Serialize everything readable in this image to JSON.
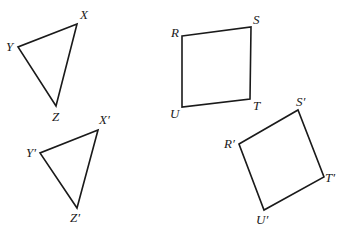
{
  "figure": {
    "stroke_color": "#1a1a1a",
    "background": "#ffffff"
  },
  "shapes": {
    "triangle_xyz": {
      "name": "XYZ",
      "points": "77,24 18,47 56,106",
      "labels": {
        "X": {
          "text": "X",
          "x": 80,
          "y": 19
        },
        "Y": {
          "text": "Y",
          "x": 6,
          "y": 51
        },
        "Z": {
          "text": "Z",
          "x": 52,
          "y": 121
        }
      }
    },
    "quad_rstu": {
      "name": "RSTU",
      "points": "182,36 251,27 250,99 182,107",
      "labels": {
        "R": {
          "text": "R",
          "x": 171,
          "y": 37
        },
        "S": {
          "text": "S",
          "x": 253,
          "y": 24
        },
        "T": {
          "text": "T",
          "x": 253,
          "y": 110
        },
        "U": {
          "text": "U",
          "x": 170,
          "y": 118
        }
      }
    },
    "triangle_xyz_prime": {
      "name": "X'Y'Z'",
      "points": "98,130 40,153 77,208",
      "labels": {
        "X": {
          "text": "X′",
          "x": 99,
          "y": 124
        },
        "Y": {
          "text": "Y′",
          "x": 26,
          "y": 157
        },
        "Z": {
          "text": "Z′",
          "x": 70,
          "y": 222
        }
      }
    },
    "quad_rstu_prime": {
      "name": "R'S'T'U'",
      "points": "239,144 298,110 324,177 264,210",
      "labels": {
        "R": {
          "text": "R′",
          "x": 224,
          "y": 148
        },
        "S": {
          "text": "S′",
          "x": 296,
          "y": 106
        },
        "T": {
          "text": "T′",
          "x": 325,
          "y": 182
        },
        "U": {
          "text": "U′",
          "x": 256,
          "y": 224
        }
      }
    }
  }
}
